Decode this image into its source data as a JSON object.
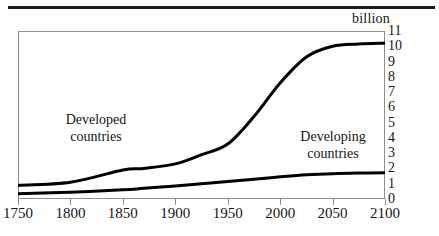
{
  "figure": {
    "unit_caption": "billion",
    "top_rule": true
  },
  "chart_data": {
    "type": "line",
    "title": "",
    "subtitle": "",
    "xlabel": "",
    "ylabel": "billion",
    "xlim": [
      1750,
      2100
    ],
    "ylim": [
      0,
      11
    ],
    "grid": false,
    "legend_position": "inline-annotations",
    "x_ticks": [
      1750,
      1800,
      1850,
      1900,
      1950,
      2000,
      2050,
      2100
    ],
    "x_tick_labels": [
      "1750",
      "1800",
      "1850",
      "1900",
      "1950",
      "2000",
      "2050",
      "2100"
    ],
    "y_ticks": [
      0,
      1,
      2,
      3,
      4,
      5,
      6,
      7,
      8,
      9,
      10,
      11
    ],
    "y_tick_labels": [
      "0",
      "1",
      "2",
      "3",
      "4",
      "5",
      "6",
      "7",
      "8",
      "9",
      "10",
      "11"
    ],
    "annotations": [
      {
        "text_line1": "Developed",
        "text_line2": "countries",
        "x": 1830,
        "y": 4.3
      },
      {
        "text_line1": "Developing",
        "text_line2": "countries",
        "x": 2030,
        "y": 3.3
      }
    ],
    "x": [
      1750,
      1800,
      1850,
      1870,
      1900,
      1925,
      1950,
      1975,
      2000,
      2025,
      2050,
      2075,
      2100
    ],
    "series": [
      {
        "name": "Developing countries",
        "values": [
          0.9,
          1.1,
          1.9,
          2.0,
          2.3,
          2.9,
          3.6,
          5.4,
          7.6,
          9.3,
          10.0,
          10.15,
          10.2
        ],
        "color": "#000000",
        "linewidth": 3
      },
      {
        "name": "Developed countries",
        "values": [
          0.35,
          0.45,
          0.6,
          0.7,
          0.85,
          1.0,
          1.15,
          1.3,
          1.45,
          1.58,
          1.66,
          1.7,
          1.72
        ],
        "color": "#000000",
        "linewidth": 3
      }
    ]
  }
}
